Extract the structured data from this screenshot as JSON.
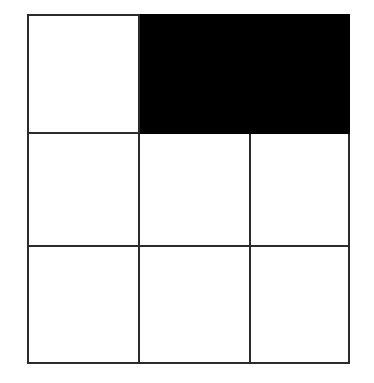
{
  "figure": {
    "type": "grid-diagram",
    "background_color": "#ffffff",
    "line_color": "#2b2b2b",
    "fill_color": "#000000",
    "empty_color": "#ffffff",
    "columns": 3,
    "rows": 3,
    "grid": {
      "left": 27,
      "top": 14,
      "width": 321,
      "height": 348,
      "column_widths": [
        111,
        111,
        99
      ],
      "row_heights": [
        118,
        113,
        117
      ]
    },
    "cells": [
      {
        "id": "cell-r1c1",
        "row": 1,
        "col": 1,
        "colspan": 1,
        "state": "empty",
        "fill": "#ffffff",
        "label": ""
      },
      {
        "id": "cell-r1c2-c3",
        "row": 1,
        "col": 2,
        "colspan": 2,
        "state": "filled",
        "fill": "#000000",
        "label": ""
      },
      {
        "id": "cell-r2c1",
        "row": 2,
        "col": 1,
        "colspan": 1,
        "state": "empty",
        "fill": "#ffffff",
        "label": ""
      },
      {
        "id": "cell-r2c2",
        "row": 2,
        "col": 2,
        "colspan": 1,
        "state": "empty",
        "fill": "#ffffff",
        "label": ""
      },
      {
        "id": "cell-r2c3",
        "row": 2,
        "col": 3,
        "colspan": 1,
        "state": "empty",
        "fill": "#ffffff",
        "label": ""
      },
      {
        "id": "cell-r3c1",
        "row": 3,
        "col": 1,
        "colspan": 1,
        "state": "empty",
        "fill": "#ffffff",
        "label": ""
      },
      {
        "id": "cell-r3c2",
        "row": 3,
        "col": 2,
        "colspan": 1,
        "state": "empty",
        "fill": "#ffffff",
        "label": ""
      },
      {
        "id": "cell-r3c3",
        "row": 3,
        "col": 3,
        "colspan": 1,
        "state": "empty",
        "fill": "#ffffff",
        "label": ""
      }
    ]
  }
}
